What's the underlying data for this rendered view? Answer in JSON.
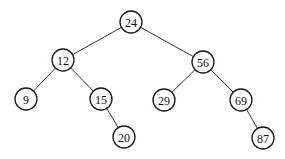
{
  "diagram": {
    "type": "binary-search-tree",
    "node_radius": 11,
    "nodes": [
      {
        "id": "n24",
        "label": "24",
        "x": 131,
        "y": 22
      },
      {
        "id": "n12",
        "label": "12",
        "x": 63,
        "y": 60
      },
      {
        "id": "n56",
        "label": "56",
        "x": 203,
        "y": 62
      },
      {
        "id": "n9",
        "label": "9",
        "x": 26,
        "y": 99
      },
      {
        "id": "n15",
        "label": "15",
        "x": 101,
        "y": 99
      },
      {
        "id": "n29",
        "label": "29",
        "x": 164,
        "y": 100
      },
      {
        "id": "n69",
        "label": "69",
        "x": 241,
        "y": 100
      },
      {
        "id": "n20",
        "label": "20",
        "x": 124,
        "y": 137
      },
      {
        "id": "n87",
        "label": "87",
        "x": 263,
        "y": 138
      }
    ],
    "edges": [
      {
        "from": "n24",
        "to": "n12"
      },
      {
        "from": "n24",
        "to": "n56"
      },
      {
        "from": "n12",
        "to": "n9"
      },
      {
        "from": "n12",
        "to": "n15"
      },
      {
        "from": "n15",
        "to": "n20"
      },
      {
        "from": "n56",
        "to": "n29"
      },
      {
        "from": "n56",
        "to": "n69"
      },
      {
        "from": "n69",
        "to": "n87"
      }
    ]
  }
}
